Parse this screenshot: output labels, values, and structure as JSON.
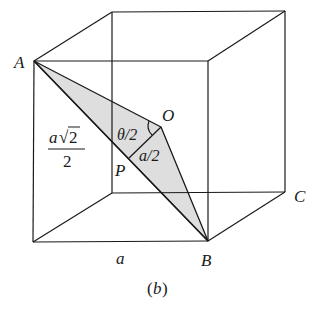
{
  "figure": {
    "caption": "(b)",
    "caption_parts": {
      "open": "(",
      "letter": "b",
      "close": ")"
    },
    "colors": {
      "line": "#1a1a1a",
      "shade": "#dedede",
      "background": "#ffffff"
    }
  },
  "points": {
    "A": {
      "label": "A"
    },
    "B": {
      "label": "B"
    },
    "C": {
      "label": "C"
    },
    "O": {
      "label": "O"
    },
    "P": {
      "label": "P"
    }
  },
  "annotations": {
    "angle": "θ/2",
    "half_edge": "a/2",
    "edge": "a",
    "half_diagonal": {
      "numerator_var": "a",
      "numerator_root": "√",
      "numerator_radicand": "2",
      "denominator": "2"
    }
  }
}
